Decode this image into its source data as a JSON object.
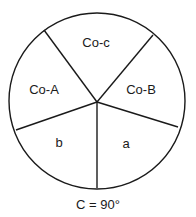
{
  "diagram": {
    "circle": {
      "cx": 97,
      "cy": 101,
      "r": 88,
      "stroke": "#1a1a1a"
    },
    "hub": {
      "x": 97,
      "y": 102
    },
    "spokes": [
      {
        "name": "spoke-upper-left",
        "x": 44,
        "y": 30
      },
      {
        "name": "spoke-upper-right",
        "x": 153,
        "y": 35
      },
      {
        "name": "spoke-right",
        "x": 178,
        "y": 127
      },
      {
        "name": "spoke-bottom",
        "x": 97,
        "y": 188
      },
      {
        "name": "spoke-left",
        "x": 16,
        "y": 130
      }
    ],
    "segments": [
      {
        "label": "Co-c",
        "x": 96,
        "y": 47
      },
      {
        "label": "Co-A",
        "x": 44,
        "y": 94
      },
      {
        "label": "Co-B",
        "x": 141,
        "y": 94
      },
      {
        "label": "b",
        "x": 59,
        "y": 147
      },
      {
        "label": "a",
        "x": 126,
        "y": 148
      }
    ],
    "caption": {
      "text": "C = 90°",
      "x": 98,
      "y": 209
    }
  }
}
